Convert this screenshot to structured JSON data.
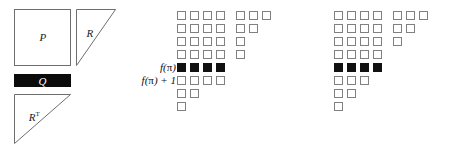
{
  "figure": {
    "background": "#ffffff",
    "outline_color": "#808080",
    "fill_color": "#111111"
  },
  "left_diagram": {
    "name": "qr-decomposition-block-diagram",
    "blocks": [
      {
        "id": "p",
        "label": "P",
        "shape": "square",
        "x": 14,
        "y": 9,
        "width": 57,
        "height": 57,
        "fill": "#ffffff",
        "stroke": "#6e6e6e"
      },
      {
        "id": "r",
        "label": "R",
        "shape": "right-triangle-upper",
        "x": 76,
        "y": 9,
        "width": 40,
        "height": 57,
        "fill": "#ffffff",
        "stroke": "#6e6e6e"
      },
      {
        "id": "q",
        "label": "Q",
        "shape": "filled-bar",
        "x": 14,
        "y": 74,
        "width": 57,
        "height": 13,
        "fill": "#0b0b0b",
        "stroke": "#0b0b0b"
      },
      {
        "id": "rt",
        "label": "R",
        "label_superscript": "T",
        "shape": "right-triangle-upper",
        "x": 14,
        "y": 94,
        "width": 57,
        "height": 50,
        "fill": "#ffffff",
        "stroke": "#6e6e6e"
      }
    ]
  },
  "middle_grid": {
    "name": "young-diagram-middle",
    "origin_x": 177,
    "origin_y": 11,
    "cell_size": 9,
    "pitch": 13,
    "group_gap": 7,
    "row_labels": [
      {
        "row_index": 4,
        "text_html": "f(π)"
      },
      {
        "row_index": 5,
        "text_html": "f(π) + 1"
      }
    ],
    "rows": [
      {
        "left_count": 4,
        "right_count": 3,
        "filled": false
      },
      {
        "left_count": 4,
        "right_count": 2,
        "filled": false
      },
      {
        "left_count": 4,
        "right_count": 1,
        "filled": false
      },
      {
        "left_count": 4,
        "right_count": 1,
        "filled": false
      },
      {
        "left_count": 4,
        "right_count": 0,
        "filled": true
      },
      {
        "left_count": 4,
        "right_count": 0,
        "filled": false
      },
      {
        "left_count": 2,
        "right_count": 0,
        "filled": false
      },
      {
        "left_count": 1,
        "right_count": 0,
        "filled": false
      }
    ]
  },
  "right_grid": {
    "name": "young-diagram-right",
    "origin_x": 334,
    "origin_y": 11,
    "cell_size": 9,
    "pitch": 13,
    "group_gap": 7,
    "row_labels": [],
    "rows": [
      {
        "left_count": 4,
        "right_count": 3,
        "filled": false
      },
      {
        "left_count": 4,
        "right_count": 2,
        "filled": false
      },
      {
        "left_count": 4,
        "right_count": 1,
        "filled": false
      },
      {
        "left_count": 4,
        "right_count": 0,
        "filled": false
      },
      {
        "left_count": 4,
        "right_count": 0,
        "filled": true
      },
      {
        "left_count": 3,
        "right_count": 0,
        "filled": false
      },
      {
        "left_count": 2,
        "right_count": 0,
        "filled": false
      },
      {
        "left_count": 1,
        "right_count": 0,
        "filled": false
      }
    ]
  }
}
